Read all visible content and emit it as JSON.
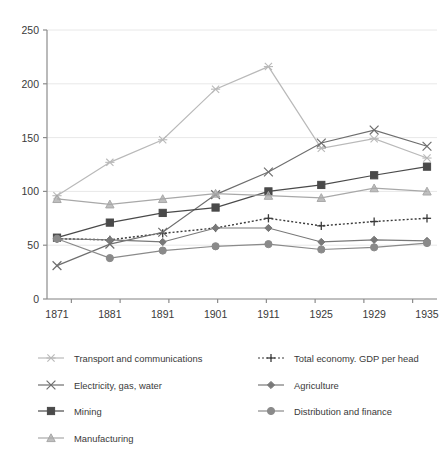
{
  "chart_data": {
    "type": "line",
    "title": "",
    "subtitle": "",
    "xlabel": "",
    "ylabel": "",
    "x": [
      "1871",
      "1881",
      "1891",
      "1901",
      "1911",
      "1925",
      "1929",
      "1935"
    ],
    "categories": [
      "1871",
      "1881",
      "1891",
      "1901",
      "1911",
      "1925",
      "1929",
      "1935"
    ],
    "xlim": [
      0,
      7
    ],
    "ylim": [
      0,
      250
    ],
    "yticks": [
      0,
      50,
      100,
      150,
      200,
      250
    ],
    "ytick_labels": [
      "0",
      "50",
      "100",
      "150",
      "200",
      "250"
    ],
    "grid": "horizontal",
    "legend_position": "bottom",
    "series": [
      {
        "name": "Transport and communications",
        "marker": "asterisk",
        "color": "#b9b9b9",
        "linestyle": "solid",
        "values": [
          96,
          127,
          148,
          195,
          216,
          140,
          149,
          131
        ]
      },
      {
        "name": "Total economy. GDP per head",
        "marker": "plus",
        "color": "#3a3a3a",
        "linestyle": "dotted",
        "values": [
          56,
          55,
          61,
          66,
          75,
          68,
          72,
          75
        ]
      },
      {
        "name": "Electricity, gas, water",
        "marker": "cross",
        "color": "#6e6e6e",
        "linestyle": "solid",
        "values": [
          31,
          51,
          62,
          97,
          118,
          145,
          157,
          142
        ]
      },
      {
        "name": "Agriculture",
        "marker": "diamond",
        "color": "#787878",
        "linestyle": "solid",
        "values": [
          56,
          55,
          53,
          66,
          66,
          53,
          55,
          54
        ]
      },
      {
        "name": "Mining",
        "marker": "square",
        "color": "#4a4a4a",
        "linestyle": "solid",
        "values": [
          57,
          71,
          80,
          85,
          100,
          106,
          115,
          123
        ]
      },
      {
        "name": "Distribution and finance",
        "marker": "circle",
        "color": "#8a8a8a",
        "linestyle": "solid",
        "values": [
          56,
          38,
          45,
          49,
          51,
          46,
          48,
          52
        ]
      },
      {
        "name": "Manufacturing",
        "marker": "triangle",
        "color": "#a8a8a8",
        "linestyle": "solid",
        "values": [
          93,
          88,
          93,
          98,
          96,
          94,
          103,
          100
        ]
      }
    ]
  },
  "axis": {
    "y_ticks": [
      "0",
      "50",
      "100",
      "150",
      "200",
      "250"
    ],
    "x_ticks": [
      "1871",
      "1881",
      "1891",
      "1901",
      "1911",
      "1925",
      "1929",
      "1935"
    ]
  },
  "legend": {
    "entries": [
      {
        "label": "Transport and communications",
        "marker": "asterisk",
        "color": "#b9b9b9",
        "linestyle": "solid"
      },
      {
        "label": "Total economy. GDP per head",
        "marker": "plus",
        "color": "#3a3a3a",
        "linestyle": "dotted"
      },
      {
        "label": "Electricity, gas, water",
        "marker": "cross",
        "color": "#6e6e6e",
        "linestyle": "solid"
      },
      {
        "label": "Agriculture",
        "marker": "diamond",
        "color": "#787878",
        "linestyle": "solid"
      },
      {
        "label": "Mining",
        "marker": "square",
        "color": "#4a4a4a",
        "linestyle": "solid"
      },
      {
        "label": "Distribution and finance",
        "marker": "circle",
        "color": "#8a8a8a",
        "linestyle": "solid"
      },
      {
        "label": "Manufacturing",
        "marker": "triangle",
        "color": "#a8a8a8",
        "linestyle": "solid"
      }
    ]
  },
  "style": {
    "background": "#ffffff",
    "grid_color": "#e8e8e8",
    "axis_color": "#8c8c8c",
    "text_color": "#3a3a3a"
  }
}
